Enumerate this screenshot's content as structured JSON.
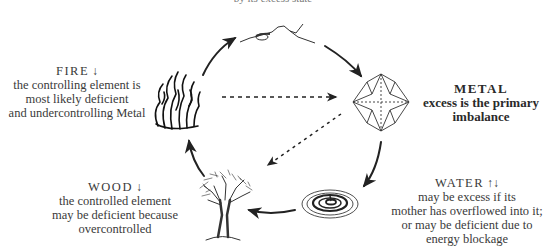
{
  "top_caption": "by its excess state",
  "elements": {
    "fire": {
      "name": "FIRE",
      "direction_icon": "down-arrow",
      "direction_glyph": "↓",
      "lines": [
        "the controlling element is",
        "most likely deficient",
        "and undercontrolling Metal"
      ]
    },
    "metal": {
      "name": "METAL",
      "lines": [
        "excess is the primary",
        "imbalance"
      ]
    },
    "water": {
      "name": "WATER",
      "direction_icon": "up-down-arrows",
      "direction_glyph": "↑↓",
      "lines": [
        "may be excess if its",
        "mother has overflowed into it;",
        "or may be deficient due to",
        "energy blockage"
      ]
    },
    "wood": {
      "name": "WOOD",
      "direction_icon": "down-arrow",
      "direction_glyph": "↓",
      "lines": [
        "the controlled element",
        "may be deficient because",
        "overcontrolled"
      ]
    }
  },
  "cycle": [
    "fire",
    "earth",
    "metal",
    "water",
    "wood"
  ],
  "control_arrows": [
    {
      "from": "fire",
      "to": "metal",
      "style": "dashed"
    },
    {
      "from": "metal",
      "to": "wood",
      "style": "dotted"
    }
  ]
}
